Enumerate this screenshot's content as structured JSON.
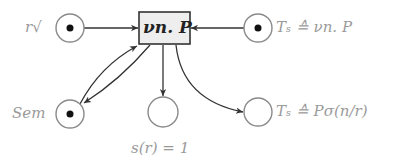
{
  "diagram": {
    "type": "petri-net",
    "transition": {
      "label": "νn. P",
      "fill": "#eeeeee",
      "stroke": "#333333"
    },
    "places": [
      {
        "id": "r_check",
        "label": "r√",
        "marked": true
      },
      {
        "id": "ts_top",
        "label": "Tₛ ≙ νn. P",
        "marked": true
      },
      {
        "id": "sem",
        "label": "Sem",
        "marked": true
      },
      {
        "id": "s_r",
        "label": "s(r) = 1",
        "marked": false
      },
      {
        "id": "ts_bottom",
        "label": "Tₛ ≙ Pσ(n/r)",
        "marked": false
      }
    ],
    "arcs": [
      {
        "from": "r_check",
        "to": "transition"
      },
      {
        "from": "ts_top",
        "to": "transition"
      },
      {
        "from": "sem",
        "to": "transition"
      },
      {
        "from": "transition",
        "to": "sem"
      },
      {
        "from": "transition",
        "to": "s_r"
      },
      {
        "from": "transition",
        "to": "ts_bottom"
      }
    ],
    "colors": {
      "place_stroke": "#8a8a8a",
      "arc": "#333333",
      "token": "#111111",
      "label": "#9a9a9a"
    }
  }
}
